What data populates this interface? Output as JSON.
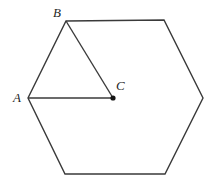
{
  "figure": {
    "width": 215,
    "height": 188,
    "background_color": "#ffffff",
    "stroke_color": "#3a3a3a",
    "stroke_width": 1.4,
    "point_color": "#141414",
    "labels": {
      "a": "A",
      "b": "B",
      "c": "C"
    },
    "hexagon": {
      "name": "hexagon-outline",
      "points": "66,21 164,20 203,98 165,174 65,174 28,98",
      "vertices": [
        {
          "name": "top-left-vertex-B",
          "x": 66,
          "y": 21
        },
        {
          "name": "top-right-vertex",
          "x": 164,
          "y": 20
        },
        {
          "name": "right-vertex",
          "x": 203,
          "y": 98
        },
        {
          "name": "bottom-right-vertex",
          "x": 165,
          "y": 174
        },
        {
          "name": "bottom-left-vertex",
          "x": 65,
          "y": 174
        },
        {
          "name": "left-vertex-A",
          "x": 28,
          "y": 98
        }
      ]
    },
    "center_point": {
      "name": "point-C",
      "x": 113,
      "y": 98,
      "radius": 2.6
    },
    "segments": [
      {
        "name": "segment-AC",
        "x1": 28,
        "y1": 98,
        "x2": 113,
        "y2": 98
      },
      {
        "name": "segment-BC",
        "x1": 66,
        "y1": 21,
        "x2": 113,
        "y2": 98
      }
    ]
  }
}
